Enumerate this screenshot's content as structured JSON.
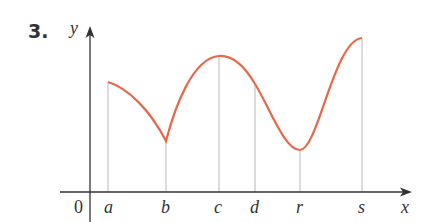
{
  "problem_number": "3.",
  "axes": {
    "x_label": "x",
    "y_label": "y",
    "origin_label": "0",
    "axis_color": "#333333",
    "guide_color": "#b8b8b8"
  },
  "curve": {
    "color": "#e8674a",
    "points": {
      "a": {
        "x": 108,
        "y": 82
      },
      "b": {
        "x": 166,
        "y": 141
      },
      "c": {
        "x": 219,
        "y": 56
      },
      "d": {
        "x": 255,
        "y": 84
      },
      "r": {
        "x": 300,
        "y": 150
      },
      "s": {
        "x": 362,
        "y": 38
      }
    }
  },
  "tick_labels": [
    "a",
    "b",
    "c",
    "d",
    "r",
    "s"
  ]
}
